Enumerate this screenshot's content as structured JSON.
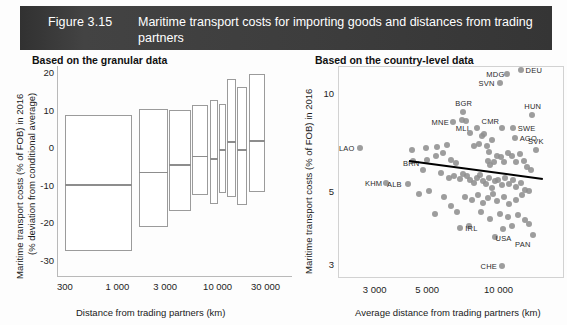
{
  "header": {
    "figure_number": "Figure 3.15",
    "title": "Maritime transport costs for importing goods and distances from trading partners",
    "bar_color": "#3a3a3a",
    "text_color": "#ffffff"
  },
  "panels": {
    "left": {
      "title": "Based on the granular data",
      "ylabel_line1": "Maritime transport costs (% of FOB) in 2016",
      "ylabel_line2": "(% deviation from conditional average)",
      "xlabel": "Distance from trading partners (km)",
      "ytick_labels": [
        "20",
        "10",
        "0",
        "-10",
        "-20",
        "-30"
      ],
      "xtick_labels": [
        "300",
        "1 000",
        "3 000",
        "10 000",
        "30 000"
      ]
    },
    "right": {
      "title": "Based on the country-level data",
      "ylabel": "Maritime transport costs (% of FOB) in 2016",
      "xlabel": "Average distance from trading partners (km)",
      "ytick_labels": [
        "10",
        "5",
        "3"
      ],
      "xtick_labels": [
        "3 000",
        "5 000",
        "10 000"
      ]
    }
  },
  "chart_data": [
    {
      "type": "bar",
      "subtype": "box-plot-boxes",
      "title": "Based on the granular data",
      "xlabel": "Distance from trading partners (km)",
      "ylabel": "Maritime transport costs (% of FOB) in 2016 (% deviation from conditional average)",
      "xscale": "log",
      "xlim": [
        250,
        40000
      ],
      "ylim": [
        -33,
        22
      ],
      "ytick_values": [
        20,
        10,
        0,
        -10,
        -20,
        -30
      ],
      "xtick_values": [
        300,
        1000,
        3000,
        10000,
        30000
      ],
      "grid": false,
      "legend": "none",
      "categories": [
        "300-1 000",
        "1 000-3 000",
        "3 000-5 000",
        "5 000-7 000",
        "7 000-9 000",
        "9 000-12 000",
        "12 000-17 000",
        "17 000-30 000"
      ],
      "boxes": [
        {
          "bin": "300-1 000",
          "x_left": 300,
          "x_right": 1400,
          "q1": -27.5,
          "median": -9.5,
          "q3": 8.8
        },
        {
          "bin": "1 000-3 000",
          "x_left": 1650,
          "x_right": 3200,
          "q1": -21.0,
          "median": -6.2,
          "q3": 10.4
        },
        {
          "bin": "3 000-5 000",
          "x_left": 3300,
          "x_right": 5400,
          "q1": -16.8,
          "median": -4.2,
          "q3": 10.2
        },
        {
          "bin": "5 000-7 000",
          "x_left": 5600,
          "x_right": 8100,
          "q1": -12.4,
          "median": -2.0,
          "q3": 11.6
        },
        {
          "bin": "7 000-9 000",
          "x_left": 8300,
          "x_right": 10200,
          "q1": -14.8,
          "median": -2.6,
          "q3": 13.0
        },
        {
          "bin": "9 000-12 000",
          "x_left": 10400,
          "x_right": 12200,
          "q1": -11.8,
          "median": -0.2,
          "q3": 11.9
        },
        {
          "bin": "12 000-17 000",
          "x_left": 12500,
          "x_right": 15400,
          "q1": -13.0,
          "median": 1.9,
          "q3": 18.6
        },
        {
          "bin": "17 000-30 000",
          "x_left": 15700,
          "x_right": 19800,
          "q1": -15.0,
          "median": -0.2,
          "q3": 16.3
        },
        {
          "bin": "20 000-30 000",
          "x_left": 20600,
          "x_right": 30000,
          "q1": -11.6,
          "median": 2.2,
          "q3": 19.9
        }
      ]
    },
    {
      "type": "scatter",
      "title": "Based on the country-level data",
      "xlabel": "Average distance from trading partners (km)",
      "ylabel": "Maritime transport costs (% of FOB) in 2016",
      "xscale": "log",
      "yscale": "log",
      "xlim": [
        2100,
        16500
      ],
      "ylim": [
        2.85,
        12.2
      ],
      "xtick_values": [
        3000,
        5000,
        10000
      ],
      "ytick_values": [
        10,
        5,
        3
      ],
      "grid": false,
      "legend": "none",
      "marker_color": "#8f8f8f",
      "trendline": {
        "x1": 4200,
        "y1": 6.3,
        "x2": 15400,
        "y2": 5.55,
        "color": "#000000"
      },
      "labeled_points": [
        {
          "label": "LAO",
          "x": 2600,
          "y": 6.85,
          "label_pos": "left"
        },
        {
          "label": "KHM",
          "x": 3350,
          "y": 5.35,
          "label_pos": "left"
        },
        {
          "label": "ALB",
          "x": 4150,
          "y": 5.3,
          "label_pos": "left"
        },
        {
          "label": "BRN",
          "x": 4800,
          "y": 5.85,
          "label_pos": "above-left"
        },
        {
          "label": "MNE",
          "x": 6400,
          "y": 8.2,
          "label_pos": "left"
        },
        {
          "label": "BGR",
          "x": 7100,
          "y": 8.8,
          "label_pos": "above"
        },
        {
          "label": "MLI",
          "x": 8100,
          "y": 7.9,
          "label_pos": "left"
        },
        {
          "label": "SVN",
          "x": 10100,
          "y": 10.8,
          "label_pos": "left"
        },
        {
          "label": "MDG",
          "x": 10900,
          "y": 11.5,
          "label_pos": "left"
        },
        {
          "label": "DEU",
          "x": 12400,
          "y": 11.9,
          "label_pos": "right"
        },
        {
          "label": "CMR",
          "x": 10300,
          "y": 7.85,
          "label_pos": "above-left"
        },
        {
          "label": "SWE",
          "x": 11500,
          "y": 7.85,
          "label_pos": "right"
        },
        {
          "label": "AGO",
          "x": 11700,
          "y": 7.35,
          "label_pos": "right"
        },
        {
          "label": "HUN",
          "x": 13900,
          "y": 8.65,
          "label_pos": "above"
        },
        {
          "label": "SVK",
          "x": 14400,
          "y": 6.75,
          "label_pos": "above"
        },
        {
          "label": "IRL",
          "x": 6900,
          "y": 3.9,
          "label_pos": "right"
        },
        {
          "label": "USA",
          "x": 10400,
          "y": 3.85,
          "label_pos": "below"
        },
        {
          "label": "PAN",
          "x": 14000,
          "y": 3.7,
          "label_pos": "below-left"
        },
        {
          "label": "CHE",
          "x": 10300,
          "y": 2.98,
          "label_pos": "left"
        }
      ],
      "unlabeled_points": [
        {
          "x": 4300,
          "y": 6.75
        },
        {
          "x": 4950,
          "y": 6.85
        },
        {
          "x": 5500,
          "y": 6.9
        },
        {
          "x": 4350,
          "y": 6.25
        },
        {
          "x": 5000,
          "y": 6.3
        },
        {
          "x": 5450,
          "y": 6.45
        },
        {
          "x": 5850,
          "y": 6.6
        },
        {
          "x": 6050,
          "y": 7.0
        },
        {
          "x": 6300,
          "y": 6.3
        },
        {
          "x": 6600,
          "y": 6.15
        },
        {
          "x": 7000,
          "y": 8.35
        },
        {
          "x": 7300,
          "y": 8.3
        },
        {
          "x": 7550,
          "y": 7.6
        },
        {
          "x": 7900,
          "y": 6.95
        },
        {
          "x": 8250,
          "y": 7.05
        },
        {
          "x": 8500,
          "y": 7.45
        },
        {
          "x": 8700,
          "y": 7.55
        },
        {
          "x": 8900,
          "y": 6.95
        },
        {
          "x": 9150,
          "y": 6.65
        },
        {
          "x": 9400,
          "y": 7.25
        },
        {
          "x": 9000,
          "y": 6.25
        },
        {
          "x": 9250,
          "y": 6.05
        },
        {
          "x": 9550,
          "y": 6.2
        },
        {
          "x": 9900,
          "y": 6.45
        },
        {
          "x": 10200,
          "y": 6.4
        },
        {
          "x": 10600,
          "y": 6.2
        },
        {
          "x": 11000,
          "y": 6.6
        },
        {
          "x": 11400,
          "y": 6.45
        },
        {
          "x": 11800,
          "y": 6.2
        },
        {
          "x": 12300,
          "y": 6.55
        },
        {
          "x": 12800,
          "y": 6.25
        },
        {
          "x": 13200,
          "y": 6.0
        },
        {
          "x": 13700,
          "y": 5.85
        },
        {
          "x": 5700,
          "y": 5.75
        },
        {
          "x": 6150,
          "y": 5.55
        },
        {
          "x": 6500,
          "y": 5.6
        },
        {
          "x": 6850,
          "y": 5.5
        },
        {
          "x": 7100,
          "y": 5.7
        },
        {
          "x": 7350,
          "y": 5.6
        },
        {
          "x": 7600,
          "y": 5.45
        },
        {
          "x": 7850,
          "y": 5.35
        },
        {
          "x": 8100,
          "y": 5.55
        },
        {
          "x": 8350,
          "y": 5.65
        },
        {
          "x": 8600,
          "y": 5.4
        },
        {
          "x": 8850,
          "y": 5.3
        },
        {
          "x": 9100,
          "y": 5.55
        },
        {
          "x": 9400,
          "y": 5.15
        },
        {
          "x": 9700,
          "y": 5.4
        },
        {
          "x": 10000,
          "y": 5.45
        },
        {
          "x": 10300,
          "y": 5.25
        },
        {
          "x": 10700,
          "y": 5.55
        },
        {
          "x": 11100,
          "y": 5.3
        },
        {
          "x": 11500,
          "y": 5.45
        },
        {
          "x": 11900,
          "y": 5.2
        },
        {
          "x": 12400,
          "y": 5.35
        },
        {
          "x": 12900,
          "y": 5.1
        },
        {
          "x": 13400,
          "y": 5.05
        },
        {
          "x": 4600,
          "y": 4.95
        },
        {
          "x": 5100,
          "y": 5.05
        },
        {
          "x": 5900,
          "y": 4.85
        },
        {
          "x": 6300,
          "y": 4.55
        },
        {
          "x": 7200,
          "y": 4.85
        },
        {
          "x": 7700,
          "y": 4.75
        },
        {
          "x": 8200,
          "y": 4.9
        },
        {
          "x": 8600,
          "y": 4.65
        },
        {
          "x": 9000,
          "y": 4.8
        },
        {
          "x": 9500,
          "y": 4.95
        },
        {
          "x": 9900,
          "y": 4.7
        },
        {
          "x": 10500,
          "y": 4.85
        },
        {
          "x": 11100,
          "y": 4.6
        },
        {
          "x": 11800,
          "y": 4.75
        },
        {
          "x": 12600,
          "y": 4.9
        },
        {
          "x": 5400,
          "y": 4.3
        },
        {
          "x": 6700,
          "y": 4.35
        },
        {
          "x": 8400,
          "y": 4.35
        },
        {
          "x": 9200,
          "y": 4.15
        },
        {
          "x": 10100,
          "y": 4.3
        },
        {
          "x": 11000,
          "y": 4.2
        },
        {
          "x": 12100,
          "y": 4.25
        },
        {
          "x": 13000,
          "y": 4.1
        },
        {
          "x": 7500,
          "y": 3.95
        },
        {
          "x": 9700,
          "y": 3.65
        },
        {
          "x": 11400,
          "y": 3.95
        },
        {
          "x": 13500,
          "y": 4.0
        }
      ]
    }
  ]
}
